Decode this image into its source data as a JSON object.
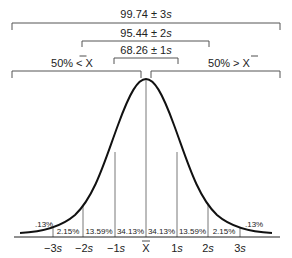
{
  "brackets": {
    "b3s": {
      "label_num": "99.74 ± 3",
      "label_s": "s"
    },
    "b2s": {
      "label_num": "95.44 ± 2",
      "label_s": "s"
    },
    "b1s": {
      "label_num": "68.26 ± 1",
      "label_s": "s"
    },
    "left_half": {
      "label": "50% < X"
    },
    "right_half": {
      "label": "50% > X"
    }
  },
  "areas": {
    "tail_left": ".13%",
    "a1": "2.15%",
    "a2": "13.59%",
    "a3": "34.13%",
    "a4": "34.13%",
    "a5": "13.59%",
    "a6": "2.15%",
    "tail_right": ".13%"
  },
  "ticks": {
    "m3": {
      "num": "−3",
      "s": "s"
    },
    "m2": {
      "num": "−2",
      "s": "s"
    },
    "m1": {
      "num": "−1",
      "s": "s"
    },
    "mean": "X",
    "p1": {
      "num": "1",
      "s": "s"
    },
    "p2": {
      "num": "2",
      "s": "s"
    },
    "p3": {
      "num": "3",
      "s": "s"
    }
  },
  "colors": {
    "stroke": "#222222",
    "thin": "#555555"
  }
}
